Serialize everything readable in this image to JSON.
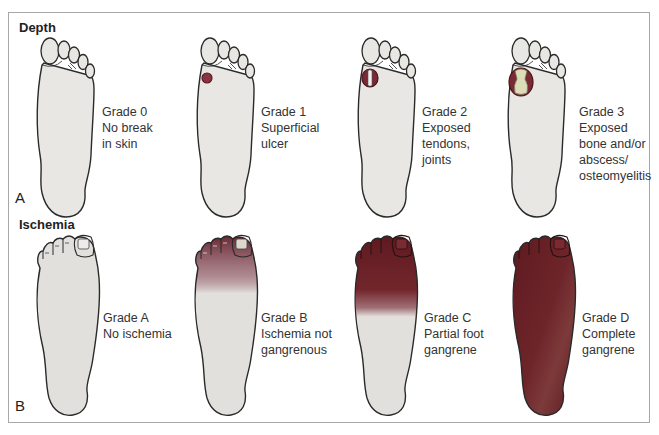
{
  "figure": {
    "panels": [
      {
        "letter": "A",
        "title": "Depth",
        "grades": [
          {
            "grade": "Grade 0",
            "lines": [
              "Grade 0",
              "No break",
              "in skin"
            ],
            "lesion": "none"
          },
          {
            "grade": "Grade 1",
            "lines": [
              "Grade 1",
              "Superficial",
              "ulcer"
            ],
            "lesion": "small-ulcer"
          },
          {
            "grade": "Grade 2",
            "lines": [
              "Grade 2",
              "Exposed",
              "tendons,",
              "joints"
            ],
            "lesion": "ulcer-exposed-tendon"
          },
          {
            "grade": "Grade 3",
            "lines": [
              "Grade 3",
              "Exposed",
              "bone and/or",
              "abscess/",
              "osteomyelitis"
            ],
            "lesion": "ulcer-exposed-bone"
          }
        ]
      },
      {
        "letter": "B",
        "title": "Ischemia",
        "grades": [
          {
            "grade": "Grade A",
            "lines": [
              "Grade A",
              "No ischemia"
            ],
            "discoloration": "none"
          },
          {
            "grade": "Grade B",
            "lines": [
              "Grade B",
              "Ischemia not",
              "gangrenous"
            ],
            "discoloration": "toes-tinged"
          },
          {
            "grade": "Grade C",
            "lines": [
              "Grade C",
              "Partial foot",
              "gangrene"
            ],
            "discoloration": "forefoot"
          },
          {
            "grade": "Grade D",
            "lines": [
              "Grade D",
              "Complete",
              "gangrene"
            ],
            "discoloration": "entire-foot"
          }
        ]
      }
    ],
    "colors": {
      "skin": "#e8e7e3",
      "outline": "#2a2a2a",
      "ulcer": "#7a2a35",
      "gangrene": "#6b1f22",
      "bone": "#dcdcb8",
      "frame": "#a8a8a8"
    }
  }
}
